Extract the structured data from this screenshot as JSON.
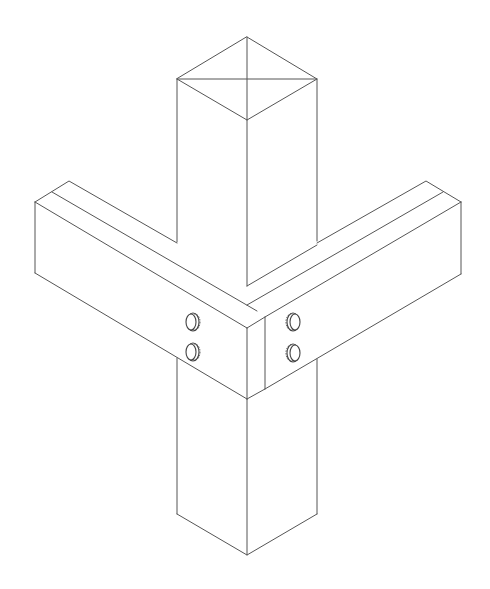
{
  "figure": {
    "title": "Isometric post and beam corner connection",
    "stroke_color": "#555555",
    "background": "#ffffff",
    "components": [
      {
        "name": "post",
        "description": "square vertical post with diagonal lines on top face"
      },
      {
        "name": "left-beam",
        "description": "rectangular beam with groove line, extends to lower-left"
      },
      {
        "name": "right-beam",
        "description": "rectangular beam with groove line, extends to lower-right"
      },
      {
        "name": "bolts",
        "count": 4,
        "layout": "two bolts on each beam end near the post"
      }
    ]
  }
}
